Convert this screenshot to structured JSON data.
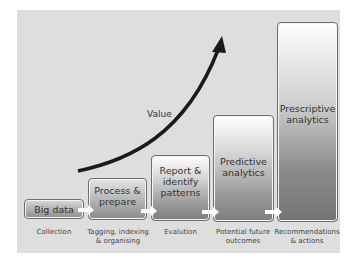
{
  "diagram": {
    "value_label": "Value",
    "stages": [
      {
        "box": "Big data",
        "caption": [
          "Collection"
        ]
      },
      {
        "box": "Process & prepare",
        "box_lines": [
          "Process &",
          "prepare"
        ],
        "caption": [
          "Tagging, indexing",
          "& organising"
        ]
      },
      {
        "box": "Report & identify patterns",
        "box_lines": [
          "Report &",
          "identify",
          "patterns"
        ],
        "caption": [
          "Evalution"
        ]
      },
      {
        "box": "Predictive analytics",
        "box_lines": [
          "Predictive",
          "analytics"
        ],
        "caption": [
          "Potential future",
          "outcomes"
        ]
      },
      {
        "box": "Prescriptive analytics",
        "box_lines": [
          "Prescriptive",
          "analytics"
        ],
        "caption": [
          "Recommendations",
          "& actions"
        ]
      }
    ],
    "colors": {
      "panel": "#dedede",
      "arrow": "#1a1a1a",
      "connector": "#ffffff"
    }
  }
}
